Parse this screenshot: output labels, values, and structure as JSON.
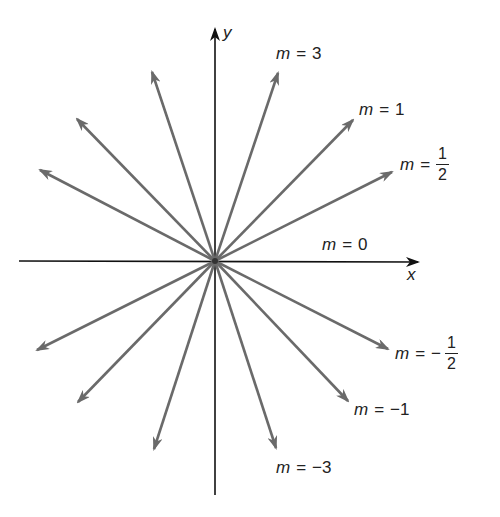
{
  "diagram": {
    "type": "slopes-through-origin",
    "origin_px": [
      215,
      261
    ],
    "colors": {
      "axis": "#111111",
      "line": "#6a6a6a",
      "text": "#222222"
    },
    "axes": {
      "x_label": "x",
      "y_label": "y"
    },
    "labels": {
      "m3": {
        "var": "m",
        "eq": "=",
        "value": "3"
      },
      "m1": {
        "var": "m",
        "eq": "=",
        "value": "1"
      },
      "mhalf": {
        "var": "m",
        "eq": "=",
        "sign": "",
        "num": "1",
        "den": "2"
      },
      "m0": {
        "var": "m",
        "eq": "=",
        "value": "0"
      },
      "mneghalf": {
        "var": "m",
        "eq": "=",
        "sign": "−",
        "num": "1",
        "den": "2"
      },
      "mneg1": {
        "var": "m",
        "eq": "=",
        "value": "−1"
      },
      "mneg3": {
        "var": "m",
        "eq": "=",
        "value": "−3"
      }
    },
    "lines": [
      {
        "slope": "3",
        "tip": [
          278,
          73
        ]
      },
      {
        "slope": "1",
        "tip": [
          353,
          120
        ]
      },
      {
        "slope": "1/2",
        "tip": [
          392,
          172
        ]
      },
      {
        "slope": "-3",
        "tip": [
          152,
          72
        ]
      },
      {
        "slope": "-1",
        "tip": [
          77,
          119
        ]
      },
      {
        "slope": "-1/2",
        "tip": [
          40,
          170
        ]
      },
      {
        "slope": "1/2",
        "tip": [
          37,
          350
        ]
      },
      {
        "slope": "1",
        "tip": [
          78,
          402
        ]
      },
      {
        "slope": "3",
        "tip": [
          154,
          449
        ]
      },
      {
        "slope": "-1/2",
        "tip": [
          388,
          349
        ]
      },
      {
        "slope": "-1",
        "tip": [
          348,
          401
        ]
      },
      {
        "slope": "-3",
        "tip": [
          276,
          448
        ]
      }
    ]
  }
}
